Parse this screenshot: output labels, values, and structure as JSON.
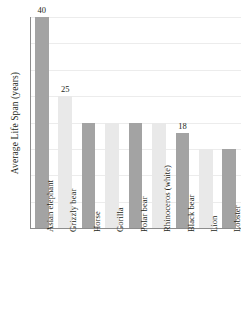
{
  "chart_data": {
    "type": "bar",
    "title": "",
    "xlabel": "",
    "ylabel": "Average Life Span (years)",
    "categories": [
      "Asian elephant",
      "Grizzly bear",
      "Horse",
      "Gorilla",
      "Polar bear",
      "Rhinoceros (white)",
      "Black bear",
      "Lion",
      "Lobster"
    ],
    "values": [
      40,
      25,
      20,
      20,
      20,
      20,
      18,
      15,
      15
    ],
    "value_labels": [
      "40",
      "25",
      "",
      "",
      "",
      "",
      "18",
      "",
      ""
    ],
    "bar_styles": [
      "dark",
      "light",
      "dark",
      "light",
      "dark",
      "light",
      "dark",
      "light",
      "dark"
    ],
    "ylim": [
      0,
      40
    ],
    "yticks": [
      0,
      5,
      10,
      15,
      20,
      25,
      30,
      35,
      40
    ],
    "grid": true,
    "legend": false
  },
  "colors": {
    "bar_dark": "#a3a3a3",
    "bar_light": "#e9e9e9",
    "gridline": "#ececec",
    "axis": "#8c8c8c",
    "text": "#231f20",
    "background": "#ffffff"
  }
}
